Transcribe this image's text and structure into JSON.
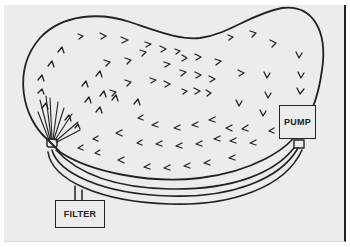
{
  "diagram": {
    "type": "pool-circulation-system",
    "components": {
      "pump": {
        "label": "PUMP"
      },
      "filter": {
        "label": "FILTER"
      },
      "return_jet": {
        "label": ""
      }
    },
    "colors": {
      "ink": "#222222",
      "paper": "#ececec",
      "background": "#ffffff"
    },
    "flow": {
      "pattern": "clockwise circulation",
      "upper_region": "arrows pointing right",
      "right_side": "arrows pointing down",
      "lower_region": "arrows pointing left",
      "left_side": "arrows pointing up from jet"
    }
  }
}
